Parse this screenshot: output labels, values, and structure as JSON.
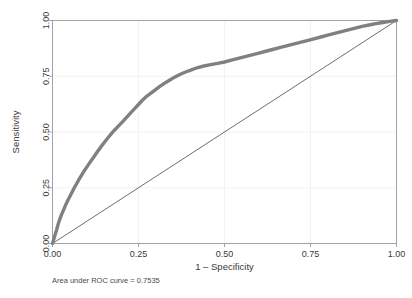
{
  "chart_data": {
    "type": "line",
    "title": "",
    "xlabel": "1 – Specificity",
    "ylabel": "Sensitivity",
    "xlim": [
      0,
      1
    ],
    "ylim": [
      0,
      1
    ],
    "grid": true,
    "legend": null,
    "xticks": [
      "0.00",
      "0.25",
      "0.50",
      "0.75",
      "1.00"
    ],
    "xtick_values": [
      0,
      0.25,
      0.5,
      0.75,
      1
    ],
    "yticks": [
      "0.00",
      "0.25",
      "0.50",
      "0.75",
      "1.00"
    ],
    "ytick_values": [
      0,
      0.25,
      0.5,
      0.75,
      1
    ],
    "annotation": "Area under ROC curve = 0.7535",
    "auc": 0.7535,
    "colors": {
      "roc_curve": "#808080",
      "reference_line": "#3c3c3c",
      "frame": "#9a9a9a",
      "grid": "#f0f0f0",
      "background": "#ffffff"
    },
    "series": [
      {
        "name": "ROC curve",
        "color": "#808080",
        "x": [
          0.0,
          0.004,
          0.008,
          0.012,
          0.016,
          0.02,
          0.026,
          0.032,
          0.038,
          0.044,
          0.05,
          0.056,
          0.062,
          0.07,
          0.078,
          0.086,
          0.094,
          0.102,
          0.11,
          0.12,
          0.13,
          0.14,
          0.15,
          0.16,
          0.17,
          0.18,
          0.19,
          0.2,
          0.212,
          0.224,
          0.236,
          0.248,
          0.26,
          0.272,
          0.284,
          0.296,
          0.31,
          0.325,
          0.34,
          0.355,
          0.37,
          0.385,
          0.4,
          0.42,
          0.44,
          0.46,
          0.48,
          0.5,
          0.52,
          0.54,
          0.56,
          0.58,
          0.6,
          0.62,
          0.64,
          0.66,
          0.68,
          0.7,
          0.72,
          0.74,
          0.76,
          0.78,
          0.8,
          0.82,
          0.84,
          0.86,
          0.88,
          0.9,
          0.92,
          0.94,
          0.96,
          0.98,
          1.0
        ],
        "y": [
          0.0,
          0.02,
          0.042,
          0.062,
          0.084,
          0.104,
          0.128,
          0.15,
          0.172,
          0.192,
          0.21,
          0.228,
          0.246,
          0.268,
          0.29,
          0.31,
          0.33,
          0.348,
          0.366,
          0.388,
          0.41,
          0.432,
          0.452,
          0.472,
          0.49,
          0.508,
          0.524,
          0.54,
          0.56,
          0.58,
          0.6,
          0.62,
          0.64,
          0.658,
          0.672,
          0.686,
          0.702,
          0.718,
          0.732,
          0.746,
          0.758,
          0.768,
          0.776,
          0.788,
          0.796,
          0.802,
          0.808,
          0.814,
          0.822,
          0.83,
          0.838,
          0.846,
          0.854,
          0.862,
          0.87,
          0.878,
          0.886,
          0.894,
          0.902,
          0.91,
          0.918,
          0.926,
          0.934,
          0.942,
          0.95,
          0.958,
          0.966,
          0.974,
          0.98,
          0.986,
          0.991,
          0.996,
          1.0
        ]
      },
      {
        "name": "Reference line",
        "color": "#3c3c3c",
        "x": [
          0,
          1
        ],
        "y": [
          0,
          1
        ]
      }
    ]
  }
}
